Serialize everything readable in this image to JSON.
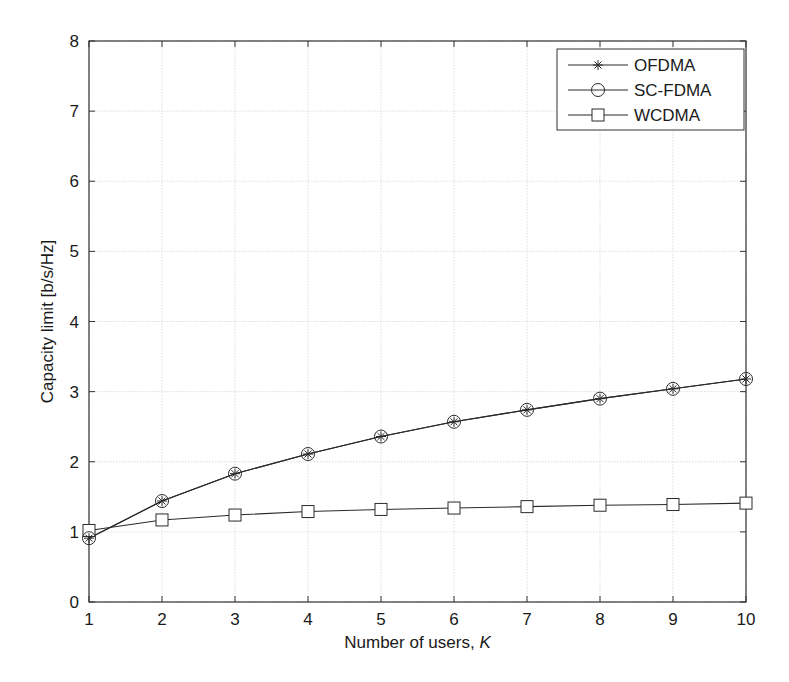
{
  "chart_data": {
    "type": "line",
    "title": "",
    "xlabel": "Number of users, ",
    "xlabel_italic": "K",
    "ylabel": "Capacity limit [b/s/Hz]",
    "xlim": [
      1,
      10
    ],
    "ylim": [
      0,
      8
    ],
    "grid": true,
    "legend_position": "upper right",
    "x": [
      1,
      2,
      3,
      4,
      5,
      6,
      7,
      8,
      9,
      10
    ],
    "xticks": [
      "1",
      "2",
      "3",
      "4",
      "5",
      "6",
      "7",
      "8",
      "9",
      "10"
    ],
    "yticks": [
      "0",
      "1",
      "2",
      "3",
      "4",
      "5",
      "6",
      "7",
      "8"
    ],
    "series": [
      {
        "name": "OFDMA",
        "marker": "asterisk",
        "values": [
          0.91,
          1.44,
          1.83,
          2.11,
          2.36,
          2.57,
          2.74,
          2.9,
          3.04,
          3.18
        ]
      },
      {
        "name": "SC-FDMA",
        "marker": "circle",
        "values": [
          0.91,
          1.44,
          1.83,
          2.11,
          2.36,
          2.57,
          2.74,
          2.9,
          3.04,
          3.18
        ]
      },
      {
        "name": "WCDMA",
        "marker": "square",
        "values": [
          1.02,
          1.17,
          1.24,
          1.29,
          1.32,
          1.34,
          1.36,
          1.38,
          1.39,
          1.41
        ]
      }
    ]
  },
  "style": {
    "line_color": "#2a2a2a",
    "grid_color": "#d4d4d4",
    "axis_color": "#333333"
  }
}
